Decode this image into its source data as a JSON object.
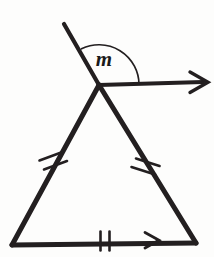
{
  "figure": {
    "background_color": "#fdfdfc",
    "stroke_color": "#231f20",
    "width": 214,
    "height": 257
  },
  "labels": {
    "angle_m": "m"
  },
  "points": {
    "apex": {
      "x": 99,
      "y": 85
    },
    "bottom_left": {
      "x": 12,
      "y": 245
    },
    "bottom_right": {
      "x": 196,
      "y": 243
    },
    "transversal_top": {
      "x": 64,
      "y": 24
    },
    "ray_end": {
      "x": 207,
      "y": 82
    }
  },
  "segments": [
    {
      "name": "transversal-upper",
      "from": {
        "x": 64,
        "y": 24
      },
      "to": {
        "x": 99,
        "y": 85
      },
      "width": 4,
      "arrow": false
    },
    {
      "name": "horizontal-ray",
      "from": {
        "x": 99,
        "y": 85
      },
      "to": {
        "x": 207,
        "y": 82
      },
      "width": 4,
      "arrow": true
    },
    {
      "name": "triangle-left-leg",
      "from": {
        "x": 99,
        "y": 85
      },
      "to": {
        "x": 12,
        "y": 245
      },
      "width": 5,
      "arrow": false
    },
    {
      "name": "triangle-right-leg",
      "from": {
        "x": 99,
        "y": 85
      },
      "to": {
        "x": 196,
        "y": 243
      },
      "width": 5,
      "arrow": false
    },
    {
      "name": "triangle-base",
      "from": {
        "x": 12,
        "y": 245
      },
      "to": {
        "x": 196,
        "y": 243
      },
      "width": 5,
      "arrow": false
    }
  ],
  "angle_arc": {
    "name": "angle-arc-m",
    "center": {
      "x": 99,
      "y": 85
    },
    "radius": 40,
    "start": {
      "x": 82,
      "y": 49
    },
    "end": {
      "x": 139,
      "y": 84
    },
    "label_position": {
      "x": 104,
      "y": 66
    },
    "stroke_width": 1.6
  },
  "tick_marks": {
    "left_leg": {
      "name": "congruence-ticks-left-leg",
      "count": 2,
      "center": {
        "x": 53,
        "y": 163
      },
      "angle_deg": 61.5
    },
    "right_leg": {
      "name": "congruence-ticks-right-leg",
      "count": 2,
      "center": {
        "x": 148,
        "y": 164
      },
      "angle_deg": 58.4
    },
    "base": {
      "name": "congruence-ticks-base",
      "count": 2,
      "center": {
        "x": 105,
        "y": 240
      },
      "angle_deg": 0
    }
  },
  "parallel_arrows": [
    {
      "name": "parallel-marker-base",
      "tip": {
        "x": 158,
        "y": 240
      },
      "size": 11
    }
  ]
}
